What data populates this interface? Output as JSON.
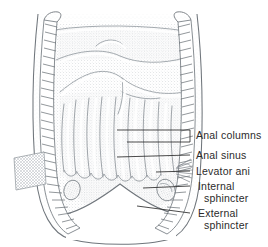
{
  "figure": {
    "type": "anatomical-illustration",
    "style": "pen-and-ink stipple drawing, grayscale",
    "background_color": "#ffffff",
    "ink_color": "#2b2b2b",
    "stipple_color": "#9aa0a6"
  },
  "labels": [
    {
      "id": "anal-columns",
      "text": "Anal columns",
      "line1": "Anal columns",
      "line2": "",
      "x": 196,
      "y": 130,
      "leader": "bracket"
    },
    {
      "id": "anal-sinus",
      "text": "Anal sinus",
      "line1": "Anal sinus",
      "line2": "",
      "x": 196,
      "y": 151,
      "leader": "line"
    },
    {
      "id": "levator-ani",
      "text": "Levator ani",
      "line1": "Levator ani",
      "line2": "",
      "x": 196,
      "y": 167,
      "leader": "line"
    },
    {
      "id": "internal-sphincter",
      "text": "Internal sphincter",
      "line1": "Internal",
      "line2": "sphincter",
      "x": 198,
      "y": 181,
      "leader": "line"
    },
    {
      "id": "external-sphincter",
      "text": "External sphincter",
      "line1": "External",
      "line2": "sphincter",
      "x": 198,
      "y": 208,
      "leader": "line"
    }
  ],
  "leaders": [
    {
      "id": "leader-anal-columns-upper",
      "from": [
        117,
        130
      ],
      "to": [
        190,
        130
      ]
    },
    {
      "id": "leader-anal-columns-lower",
      "from": [
        127,
        142
      ],
      "to": [
        190,
        142
      ]
    },
    {
      "id": "leader-anal-sinus",
      "from": [
        117,
        157
      ],
      "to": [
        190,
        155
      ]
    },
    {
      "id": "leader-levator-ani",
      "from": [
        156,
        172
      ],
      "to": [
        190,
        171
      ]
    },
    {
      "id": "leader-internal-sphincter",
      "from": [
        143,
        188
      ],
      "to": [
        190,
        186
      ]
    },
    {
      "id": "leader-external-sphincter",
      "from": [
        137,
        206
      ],
      "to": [
        190,
        213
      ]
    }
  ]
}
